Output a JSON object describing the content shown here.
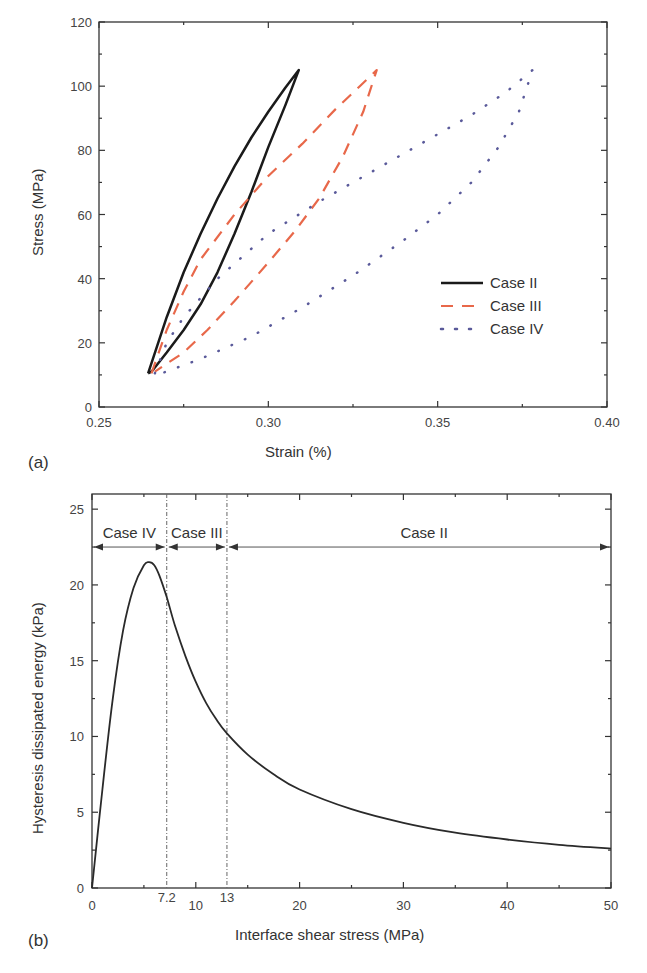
{
  "chart_data": [
    {
      "panel": "(a)",
      "type": "line",
      "title": "",
      "xlabel": "Strain (%)",
      "ylabel": "Stress (MPa)",
      "xlim": [
        0.25,
        0.4
      ],
      "ylim": [
        0,
        120
      ],
      "xticks": [
        "0.25",
        "0.30",
        "0.35",
        "0.40"
      ],
      "yticks": [
        "0",
        "20",
        "40",
        "60",
        "80",
        "100",
        "120"
      ],
      "grid": false,
      "legend_position": "lower right (inside)",
      "series": [
        {
          "name": "Case II",
          "style": "solid",
          "color": "#1a1a1a",
          "loading": [
            [
              0.2645,
              10.5
            ],
            [
              0.27,
              28
            ],
            [
              0.275,
              42
            ],
            [
              0.28,
              54
            ],
            [
              0.285,
              65
            ],
            [
              0.29,
              75
            ],
            [
              0.295,
              84
            ],
            [
              0.3,
              92
            ],
            [
              0.305,
              99.5
            ],
            [
              0.309,
              105
            ]
          ],
          "unloading": [
            [
              0.309,
              105
            ],
            [
              0.305,
              94
            ],
            [
              0.3,
              81
            ],
            [
              0.295,
              67
            ],
            [
              0.29,
              54
            ],
            [
              0.285,
              42
            ],
            [
              0.28,
              32
            ],
            [
              0.275,
              24
            ],
            [
              0.27,
              17
            ],
            [
              0.2655,
              11
            ],
            [
              0.2645,
              10.5
            ]
          ]
        },
        {
          "name": "Case III",
          "style": "dashed",
          "color": "#e8684a",
          "loading": [
            [
              0.2655,
              10.5
            ],
            [
              0.27,
              24
            ],
            [
              0.275,
              36
            ],
            [
              0.28,
              46
            ],
            [
              0.29,
              60
            ],
            [
              0.3,
              72
            ],
            [
              0.31,
              82
            ],
            [
              0.32,
              93
            ],
            [
              0.327,
              100
            ],
            [
              0.332,
              105
            ]
          ],
          "unloading": [
            [
              0.332,
              105
            ],
            [
              0.328,
              92
            ],
            [
              0.322,
              78
            ],
            [
              0.315,
              65
            ],
            [
              0.308,
              55
            ],
            [
              0.3,
              45
            ],
            [
              0.29,
              33
            ],
            [
              0.282,
              24
            ],
            [
              0.275,
              17
            ],
            [
              0.27,
              13.5
            ],
            [
              0.2665,
              11
            ]
          ]
        },
        {
          "name": "Case IV",
          "style": "dotted",
          "color": "#5a5a9a",
          "loading": [
            [
              0.2665,
              10.5
            ],
            [
              0.27,
              20
            ],
            [
              0.275,
              28
            ],
            [
              0.285,
              40
            ],
            [
              0.3,
              54
            ],
            [
              0.315,
              64
            ],
            [
              0.33,
              73
            ],
            [
              0.345,
              82
            ],
            [
              0.36,
              91
            ],
            [
              0.37,
              98
            ],
            [
              0.378,
              105
            ]
          ],
          "unloading": [
            [
              0.378,
              105
            ],
            [
              0.374,
              92
            ],
            [
              0.368,
              81
            ],
            [
              0.36,
              70
            ],
            [
              0.35,
              60
            ],
            [
              0.34,
              52
            ],
            [
              0.325,
              41
            ],
            [
              0.31,
              31
            ],
            [
              0.295,
              22
            ],
            [
              0.28,
              15
            ],
            [
              0.2685,
              10.5
            ]
          ]
        }
      ]
    },
    {
      "panel": "(b)",
      "type": "line",
      "title": "",
      "xlabel": "Interface shear stress (MPa)",
      "ylabel": "Hysteresis dissipated energy (kPa)",
      "xlim": [
        0,
        50
      ],
      "ylim": [
        0,
        25
      ],
      "xticks": [
        "0",
        "10",
        "20",
        "30",
        "40",
        "50"
      ],
      "yticks": [
        "0",
        "5",
        "10",
        "15",
        "20",
        "25"
      ],
      "grid": false,
      "annotations": {
        "vertical_lines": [
          7.2,
          13
        ],
        "vertical_line_labels": [
          "7.2",
          "13"
        ],
        "regions": [
          {
            "label": "Case IV",
            "from": 0,
            "to": 7.2
          },
          {
            "label": "Case III",
            "from": 7.2,
            "to": 13
          },
          {
            "label": "Case II",
            "from": 13,
            "to": 50
          }
        ],
        "region_arrow_y": 22.5
      },
      "series": [
        {
          "name": "Hysteresis dissipated energy",
          "style": "solid",
          "color": "#2a2a2a",
          "x": [
            0,
            1,
            2,
            3,
            4,
            5,
            5.5,
            6,
            6.5,
            7.2,
            8,
            9,
            10,
            11,
            12,
            13,
            15,
            17.5,
            20,
            25,
            30,
            35,
            40,
            45,
            50
          ],
          "y": [
            0,
            6.5,
            12.5,
            17,
            19.8,
            21.3,
            21.5,
            21.3,
            20.6,
            19.2,
            17.3,
            15.3,
            13.6,
            12.2,
            11.1,
            10.2,
            8.8,
            7.5,
            6.5,
            5.2,
            4.3,
            3.65,
            3.2,
            2.85,
            2.6
          ]
        }
      ]
    }
  ],
  "panels": {
    "a": {
      "label": "(a)",
      "xlabel": "Strain (%)",
      "ylabel": "Stress (MPa)",
      "xticks": [
        "0.25",
        "0.30",
        "0.35",
        "0.40"
      ],
      "yticks": [
        "0",
        "20",
        "40",
        "60",
        "80",
        "100",
        "120"
      ],
      "legend": [
        "Case II",
        "Case III",
        "Case IV"
      ]
    },
    "b": {
      "label": "(b)",
      "xlabel": "Interface shear stress (MPa)",
      "ylabel": "Hysteresis dissipated energy (kPa)",
      "xticks": [
        "0",
        "10",
        "20",
        "30",
        "40",
        "50"
      ],
      "yticks": [
        "0",
        "5",
        "10",
        "15",
        "20",
        "25"
      ],
      "vline_labels": [
        "7.2",
        "13"
      ],
      "regions": [
        "Case IV",
        "Case III",
        "Case II"
      ]
    }
  },
  "colors": {
    "case_ii": "#1a1a1a",
    "case_iii": "#e8684a",
    "case_iv": "#5a5a9a",
    "axis": "#333333"
  }
}
